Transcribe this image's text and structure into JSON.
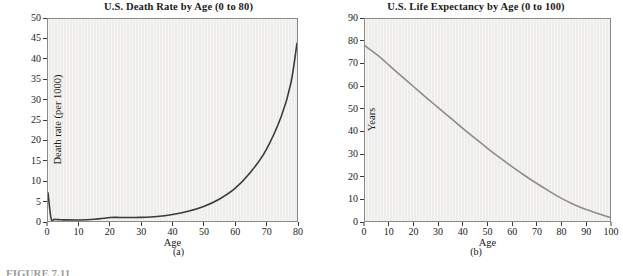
{
  "figure": {
    "caption": "FIGURE 7.11",
    "panels": [
      {
        "key": "a",
        "sub_caption": "(a)",
        "title": "U.S. Death Rate by Age (0 to 80)",
        "xlabel": "Age",
        "ylabel": "Death rate (per 1000)"
      },
      {
        "key": "b",
        "sub_caption": "(b)",
        "title": "U.S. Life Expectancy by Age (0 to 100)",
        "xlabel": "Age",
        "ylabel": "Years"
      }
    ]
  },
  "colors": {
    "plot_background": "#eeedeb",
    "plot_border": "#8a8a88",
    "curve_a": "#3b3b3b",
    "curve_b": "#8f8d8b",
    "text": "#1a1a1a"
  },
  "chart_data": [
    {
      "type": "line",
      "id": "death-rate-by-age",
      "title": "U.S. Death Rate by Age (0 to 80)",
      "xlabel": "Age",
      "ylabel": "Death rate (per 1000)",
      "xlim": [
        0,
        80
      ],
      "ylim": [
        0,
        50
      ],
      "xticks": [
        0,
        10,
        20,
        30,
        40,
        50,
        60,
        70,
        80
      ],
      "yticks": [
        0,
        5,
        10,
        15,
        20,
        25,
        30,
        35,
        40,
        45,
        50
      ],
      "grid": "vertical-faint",
      "legend": "none",
      "series": [
        {
          "name": "Death rate (per 1000)",
          "color": "#3b3b3b",
          "x": [
            0,
            1,
            2,
            3,
            4,
            5,
            10,
            15,
            20,
            22,
            25,
            30,
            35,
            40,
            45,
            50,
            55,
            60,
            65,
            70,
            75,
            78,
            80
          ],
          "values": [
            7.0,
            0.6,
            0.4,
            0.35,
            0.3,
            0.28,
            0.25,
            0.45,
            0.85,
            0.9,
            0.85,
            0.9,
            1.1,
            1.6,
            2.4,
            3.6,
            5.4,
            8.0,
            12.0,
            17.5,
            26.0,
            34.0,
            44.0
          ]
        }
      ]
    },
    {
      "type": "line",
      "id": "life-expectancy-by-age",
      "title": "U.S. Life Expectancy by Age (0 to 100)",
      "xlabel": "Age",
      "ylabel": "Years",
      "xlim": [
        0,
        100
      ],
      "ylim": [
        0,
        90
      ],
      "xticks": [
        0,
        10,
        20,
        30,
        40,
        50,
        60,
        70,
        80,
        90,
        100
      ],
      "yticks": [
        0,
        10,
        20,
        30,
        40,
        50,
        60,
        70,
        80,
        90
      ],
      "grid": "vertical-faint",
      "legend": "none",
      "series": [
        {
          "name": "Years of life remaining",
          "color": "#8f8d8b",
          "x": [
            0,
            5,
            10,
            15,
            20,
            25,
            30,
            35,
            40,
            45,
            50,
            55,
            60,
            65,
            70,
            75,
            80,
            85,
            90,
            95,
            100
          ],
          "values": [
            78.0,
            74.0,
            69.2,
            64.4,
            59.7,
            55.0,
            50.4,
            45.8,
            41.2,
            36.8,
            32.4,
            28.2,
            24.2,
            20.4,
            16.8,
            13.4,
            10.2,
            7.5,
            5.2,
            3.3,
            1.6
          ]
        }
      ]
    }
  ]
}
